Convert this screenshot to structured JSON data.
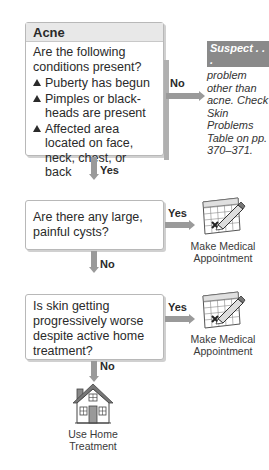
{
  "title": "Acne",
  "step1": {
    "question": "Are the following conditions present?",
    "conditions": [
      "Puberty has begun",
      "Pimples or black-heads are present",
      "Affected area located on face, neck, chest, or back"
    ],
    "no_label": "No",
    "yes_label": "Yes"
  },
  "suspect": {
    "tag": "Suspect . . .",
    "text": "problem other than acne. Check Skin Problems Table on pp. 370–371."
  },
  "step2": {
    "question": "Are there any large, painful cysts?",
    "yes_label": "Yes",
    "no_label": "No",
    "outcome_icon": "calendar-pencil-icon",
    "outcome_line1": "Make Medical",
    "outcome_line2": "Appointment"
  },
  "step3": {
    "question": "Is skin getting progressively worse despite active home treatment?",
    "yes_label": "Yes",
    "no_label": "No",
    "outcome_icon": "calendar-pencil-icon",
    "outcome_line1": "Make Medical",
    "outcome_line2": "Appointment"
  },
  "final": {
    "icon": "house-icon",
    "line1": "Use Home",
    "line2": "Treatment"
  },
  "colors": {
    "connector": "#9a9a9a",
    "header_bg": "#e8e8e8",
    "suspect_tag_bg": "#8a8a8a"
  }
}
